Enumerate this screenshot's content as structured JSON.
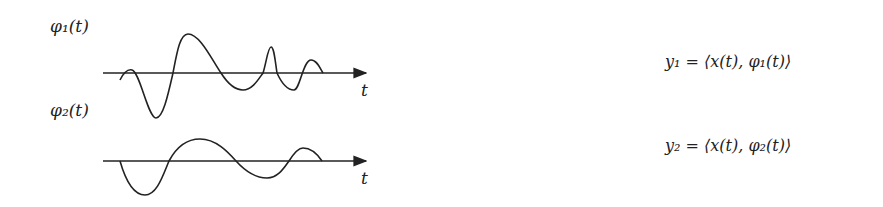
{
  "diagram": {
    "basis_functions": [
      {
        "label": "φ₁(t)",
        "axis_label": "t",
        "equation": "y₁ = ⟨x(t), φ₁(t)⟩"
      },
      {
        "label": "φ₂(t)",
        "axis_label": "t",
        "equation": "y₂ = ⟨x(t), φ₂(t)⟩"
      }
    ],
    "colors": {
      "stroke": "#222222",
      "background": "#ffffff"
    }
  }
}
